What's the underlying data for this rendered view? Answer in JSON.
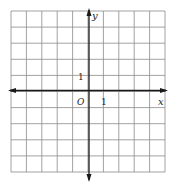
{
  "diagram": {
    "type": "coordinate-grid",
    "grid": {
      "columns": 10,
      "rows": 10,
      "x_range": [
        -5,
        5
      ],
      "y_range": [
        -5,
        5
      ]
    },
    "axes": {
      "x_label": "x",
      "y_label": "y",
      "origin_label": "O",
      "x_unit_label": "1",
      "y_unit_label": "1"
    },
    "colors": {
      "grid": "#8a8a8a",
      "axis": "#1a1a1a",
      "background": "#ffffff"
    }
  }
}
